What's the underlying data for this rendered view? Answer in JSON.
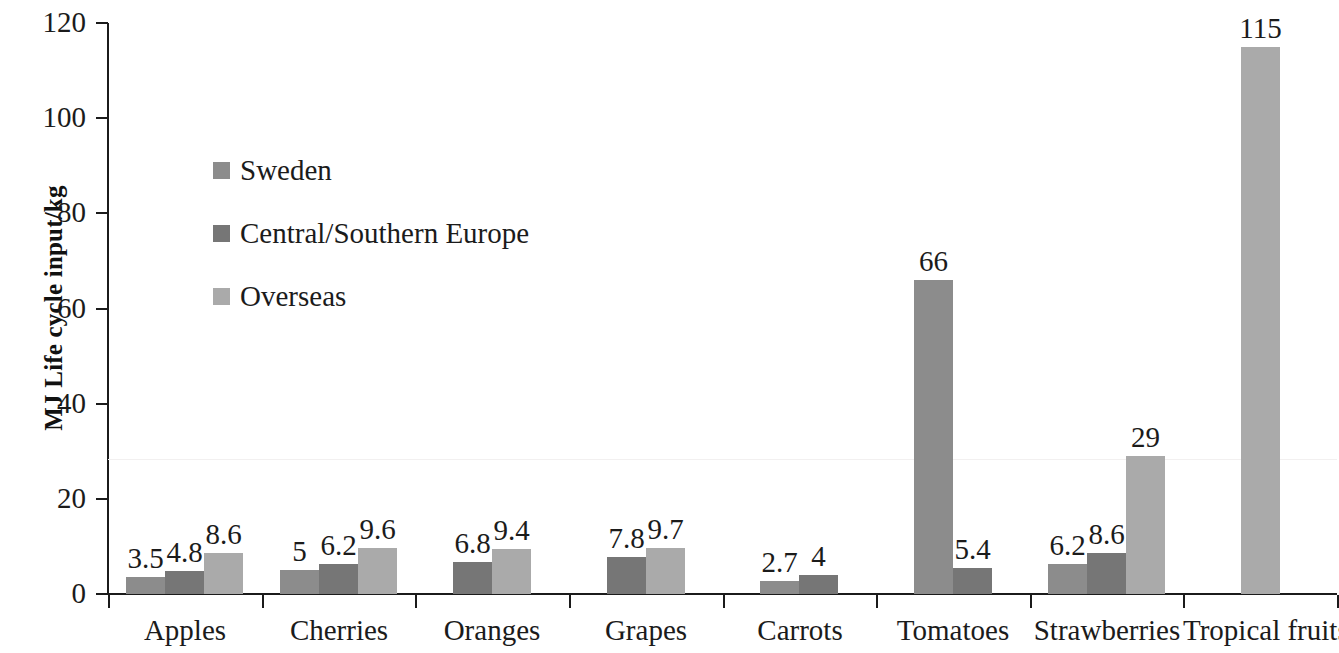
{
  "chart_data": {
    "type": "bar",
    "title": "",
    "subtitle": "",
    "xlabel": "",
    "ylabel": "MJ Life cycle input/kg",
    "ylim": [
      0,
      120
    ],
    "yticks": [
      0,
      20,
      40,
      60,
      80,
      100,
      120
    ],
    "grid": false,
    "legend_position": "inside-upper-left",
    "categories": [
      "Apples",
      "Cherries",
      "Oranges",
      "Grapes",
      "Carrots",
      "Tomatoes",
      "Strawberries",
      "Tropical fruits"
    ],
    "series": [
      {
        "name": "Sweden",
        "color": "#8c8c8c",
        "values": [
          3.5,
          5,
          null,
          null,
          2.7,
          66,
          6.2,
          null
        ],
        "labels": [
          "3.5",
          "5",
          "",
          "",
          "2.7",
          "66",
          "6.2",
          ""
        ]
      },
      {
        "name": "Central/Southern Europe",
        "color": "#767676",
        "values": [
          4.8,
          6.2,
          6.8,
          7.8,
          4,
          5.4,
          8.6,
          null
        ],
        "labels": [
          "4.8",
          "6.2",
          "6.8",
          "7.8",
          "4",
          "5.4",
          "8.6",
          ""
        ]
      },
      {
        "name": "Overseas",
        "color": "#aaaaaa",
        "values": [
          8.6,
          9.6,
          9.4,
          9.7,
          null,
          null,
          29,
          115
        ],
        "labels": [
          "8.6",
          "9.6",
          "9.4",
          "9.7",
          "",
          "",
          "29",
          "115"
        ]
      }
    ]
  },
  "axis": {
    "y_title": "MJ Life cycle input/kg",
    "y_tick_labels": [
      "0",
      "20",
      "40",
      "60",
      "80",
      "100",
      "120"
    ],
    "x_tick_labels": [
      "Apples",
      "Cherries",
      "Oranges",
      "Grapes",
      "Carrots",
      "Tomatoes",
      "Strawberries",
      "Tropical fruits"
    ]
  },
  "legend": {
    "items": [
      {
        "label": "Sweden",
        "color": "#8c8c8c"
      },
      {
        "label": "Central/Southern Europe",
        "color": "#767676"
      },
      {
        "label": "Overseas",
        "color": "#aaaaaa"
      }
    ]
  },
  "bars": [
    {
      "value_label": "3.5",
      "series": "Sweden",
      "category": "Apples"
    },
    {
      "value_label": "4.8",
      "series": "Central/Southern Europe",
      "category": "Apples"
    },
    {
      "value_label": "8.6",
      "series": "Overseas",
      "category": "Apples"
    },
    {
      "value_label": "5",
      "series": "Sweden",
      "category": "Cherries"
    },
    {
      "value_label": "6.2",
      "series": "Central/Southern Europe",
      "category": "Cherries"
    },
    {
      "value_label": "9.6",
      "series": "Overseas",
      "category": "Cherries"
    },
    {
      "value_label": "6.8",
      "series": "Central/Southern Europe",
      "category": "Oranges"
    },
    {
      "value_label": "9.4",
      "series": "Overseas",
      "category": "Oranges"
    },
    {
      "value_label": "7.8",
      "series": "Central/Southern Europe",
      "category": "Grapes"
    },
    {
      "value_label": "9.7",
      "series": "Overseas",
      "category": "Grapes"
    },
    {
      "value_label": "2.7",
      "series": "Sweden",
      "category": "Carrots"
    },
    {
      "value_label": "4",
      "series": "Central/Southern Europe",
      "category": "Carrots"
    },
    {
      "value_label": "66",
      "series": "Sweden",
      "category": "Tomatoes"
    },
    {
      "value_label": "5.4",
      "series": "Central/Southern Europe",
      "category": "Tomatoes"
    },
    {
      "value_label": "6.2",
      "series": "Sweden",
      "category": "Strawberries"
    },
    {
      "value_label": "8.6",
      "series": "Central/Southern Europe",
      "category": "Strawberries"
    },
    {
      "value_label": "29",
      "series": "Overseas",
      "category": "Strawberries"
    },
    {
      "value_label": "115",
      "series": "Overseas",
      "category": "Tropical fruits"
    }
  ]
}
